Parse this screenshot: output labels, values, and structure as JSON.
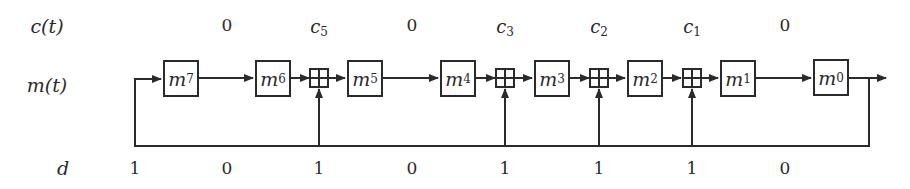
{
  "row_labels": {
    "c": "c(t)",
    "m": "m(t)",
    "d": "d"
  },
  "registers": [
    {
      "base": "m",
      "sub": "7",
      "x": 163
    },
    {
      "base": "m",
      "sub": "6",
      "x": 255
    },
    {
      "base": "m",
      "sub": "5",
      "x": 347
    },
    {
      "base": "m",
      "sub": "4",
      "x": 440
    },
    {
      "base": "m",
      "sub": "3",
      "x": 534
    },
    {
      "base": "m",
      "sub": "2",
      "x": 627
    },
    {
      "base": "m",
      "sub": "1",
      "x": 720
    },
    {
      "base": "m",
      "sub": "0",
      "x": 813
    }
  ],
  "c_row": [
    {
      "text": "0",
      "x": 227
    },
    {
      "base": "c",
      "sub": "5",
      "x": 319
    },
    {
      "text": "0",
      "x": 412
    },
    {
      "base": "c",
      "sub": "3",
      "x": 505
    },
    {
      "base": "c",
      "sub": "2",
      "x": 599
    },
    {
      "base": "c",
      "sub": "1",
      "x": 692
    },
    {
      "text": "0",
      "x": 785
    }
  ],
  "d_row": [
    {
      "text": "1",
      "x": 135
    },
    {
      "text": "0",
      "x": 227
    },
    {
      "text": "1",
      "x": 319
    },
    {
      "text": "0",
      "x": 412
    },
    {
      "text": "1",
      "x": 505
    },
    {
      "text": "1",
      "x": 599
    },
    {
      "text": "1",
      "x": 692
    },
    {
      "text": "0",
      "x": 785
    }
  ],
  "adders_x": [
    319,
    505,
    599,
    692
  ],
  "colors": {
    "stroke": "#2a2a2a",
    "background": "#ffffff"
  }
}
